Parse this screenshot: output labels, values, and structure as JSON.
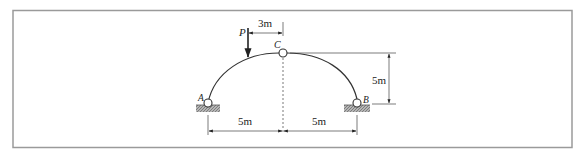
{
  "figure": {
    "type": "three-hinged arch",
    "labels": {
      "load": "P",
      "crown_hinge": "C",
      "left_support": "A",
      "right_support": "B"
    },
    "dimensions": {
      "load_offset": "3m",
      "left_span": "5m",
      "right_span": "5m",
      "rise": "5m"
    },
    "colors": {
      "line": "#222222",
      "frame": "#999999",
      "hatch": "#8a8a8a"
    }
  }
}
